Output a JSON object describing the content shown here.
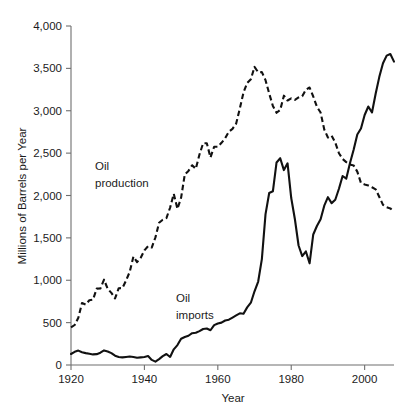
{
  "figure": {
    "source_note": "SOURCE: DATA FROM U.S. ENERGY INFORMATION ADMINISTRATION."
  },
  "labels": {
    "production": "Oil\nproduction",
    "production_line1": "Oil",
    "production_line2": "production",
    "imports_line1": "Oil",
    "imports_line2": "imports"
  },
  "chart_data": {
    "type": "line",
    "title": "",
    "xlabel": "Year",
    "ylabel": "Millions of Barrels per Year",
    "xlim": [
      1920,
      2008
    ],
    "ylim": [
      0,
      4000
    ],
    "xticks": [
      1920,
      1940,
      1960,
      1980,
      2000
    ],
    "xtick_labels": [
      "1920",
      "1940",
      "1960",
      "1980",
      "2000"
    ],
    "yticks": [
      0,
      500,
      1000,
      1500,
      2000,
      2500,
      3000,
      3500,
      4000
    ],
    "ytick_labels": [
      "0",
      "500",
      "1,000",
      "1,500",
      "2,000",
      "2,500",
      "3,000",
      "3,500",
      "4,000"
    ],
    "grid": false,
    "legend": "inline-annotations",
    "colors": {
      "line": "#111111",
      "axis": "#6f6f6f",
      "source_text": "#8d8d8d"
    },
    "series": [
      {
        "name": "Oil production",
        "style": "dashed",
        "x": [
          1920,
          1921,
          1922,
          1923,
          1924,
          1925,
          1926,
          1927,
          1928,
          1929,
          1930,
          1931,
          1932,
          1933,
          1934,
          1935,
          1936,
          1937,
          1938,
          1939,
          1940,
          1941,
          1942,
          1943,
          1944,
          1945,
          1946,
          1947,
          1948,
          1949,
          1950,
          1951,
          1952,
          1953,
          1954,
          1955,
          1956,
          1957,
          1958,
          1959,
          1960,
          1961,
          1962,
          1963,
          1964,
          1965,
          1966,
          1967,
          1968,
          1969,
          1970,
          1971,
          1972,
          1973,
          1974,
          1975,
          1976,
          1977,
          1978,
          1979,
          1980,
          1981,
          1982,
          1983,
          1984,
          1985,
          1986,
          1987,
          1988,
          1989,
          1990,
          1991,
          1992,
          1993,
          1994,
          1995,
          1996,
          1997,
          1998,
          1999,
          2000,
          2001,
          2002,
          2003,
          2004,
          2005,
          2006,
          2007,
          2008
        ],
        "y": [
          443,
          472,
          558,
          732,
          714,
          764,
          771,
          901,
          902,
          1007,
          898,
          851,
          785,
          906,
          908,
          997,
          1100,
          1279,
          1214,
          1265,
          1353,
          1402,
          1386,
          1506,
          1678,
          1714,
          1734,
          1857,
          2020,
          1842,
          1974,
          2248,
          2290,
          2357,
          2315,
          2484,
          2617,
          2617,
          2449,
          2575,
          2575,
          2622,
          2676,
          2753,
          2787,
          2849,
          3028,
          3216,
          3329,
          3372,
          3517,
          3454,
          3456,
          3361,
          3203,
          3057,
          2976,
          3009,
          3178,
          3121,
          3146,
          3129,
          3157,
          3171,
          3250,
          3274,
          3168,
          3047,
          2979,
          2779,
          2685,
          2707,
          2625,
          2499,
          2431,
          2394,
          2366,
          2355,
          2282,
          2147,
          2131,
          2118,
          2097,
          2073,
          1983,
          1890,
          1862,
          1848,
          1812
        ]
      },
      {
        "name": "Oil imports",
        "style": "solid",
        "x": [
          1920,
          1921,
          1922,
          1923,
          1924,
          1925,
          1926,
          1927,
          1928,
          1929,
          1930,
          1931,
          1932,
          1933,
          1934,
          1935,
          1936,
          1937,
          1938,
          1939,
          1940,
          1941,
          1942,
          1943,
          1944,
          1945,
          1946,
          1947,
          1948,
          1949,
          1950,
          1951,
          1952,
          1953,
          1954,
          1955,
          1956,
          1957,
          1958,
          1959,
          1960,
          1961,
          1962,
          1963,
          1964,
          1965,
          1966,
          1967,
          1968,
          1969,
          1970,
          1971,
          1972,
          1973,
          1974,
          1975,
          1976,
          1977,
          1978,
          1979,
          1980,
          1981,
          1982,
          1983,
          1984,
          1985,
          1986,
          1987,
          1988,
          1989,
          1990,
          1991,
          1992,
          1993,
          1994,
          1995,
          1996,
          1997,
          1998,
          1999,
          2000,
          2001,
          2002,
          2003,
          2004,
          2005,
          2006,
          2007,
          2008
        ],
        "y": [
          130,
          155,
          170,
          150,
          140,
          133,
          125,
          128,
          145,
          172,
          160,
          140,
          110,
          95,
          90,
          95,
          100,
          95,
          85,
          90,
          95,
          105,
          60,
          40,
          70,
          105,
          130,
          95,
          185,
          235,
          310,
          330,
          345,
          375,
          380,
          400,
          425,
          430,
          410,
          470,
          490,
          500,
          525,
          535,
          560,
          585,
          610,
          605,
          680,
          735,
          870,
          985,
          1250,
          1780,
          2030,
          2050,
          2390,
          2440,
          2300,
          2380,
          1970,
          1720,
          1410,
          1285,
          1340,
          1200,
          1540,
          1640,
          1720,
          1880,
          1980,
          1910,
          1950,
          2080,
          2230,
          2200,
          2380,
          2540,
          2720,
          2790,
          2950,
          3050,
          2980,
          3200,
          3400,
          3560,
          3650,
          3670,
          3580
        ]
      }
    ]
  }
}
